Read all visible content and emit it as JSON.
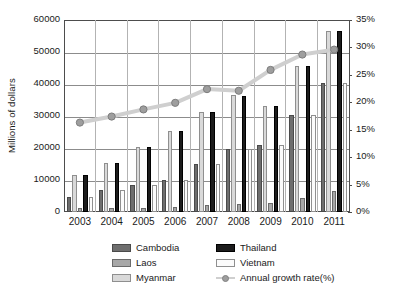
{
  "chart_data": {
    "type": "bar",
    "title": "",
    "xlabel": "",
    "ylabel": "Millions of dollars",
    "y2label": "",
    "categories": [
      "2003",
      "2004",
      "2005",
      "2006",
      "2007",
      "2008",
      "2009",
      "2010",
      "2011"
    ],
    "ylim": [
      0,
      60000
    ],
    "y2lim": [
      0,
      35
    ],
    "yticks": [
      "0",
      "10000",
      "20000",
      "30000",
      "40000",
      "50000",
      "60000"
    ],
    "y2ticks": [
      "0%",
      "5%",
      "10%",
      "15%",
      "20%",
      "25%",
      "30%",
      "35%"
    ],
    "grid": true,
    "legend_position": "bottom",
    "series": [
      {
        "name": "Cambodia",
        "axis": "left",
        "color": "#6e6e6e",
        "values": [
          4700,
          6900,
          8300,
          10000,
          15000,
          19700,
          21000,
          30200,
          40200
        ]
      },
      {
        "name": "Myanmar",
        "axis": "left",
        "color": "#d9d9d9",
        "values": [
          11600,
          15200,
          20300,
          25400,
          31200,
          36500,
          33200,
          45700,
          56700
        ]
      },
      {
        "name": "Laos",
        "axis": "left",
        "color": "#a8a8a8",
        "values": [
          1100,
          1300,
          1300,
          1600,
          2200,
          2600,
          2900,
          4400,
          6600
        ]
      },
      {
        "name": "Thailand",
        "axis": "left",
        "color": "#1c1c1c",
        "values": [
          11600,
          15200,
          20300,
          25400,
          31200,
          36400,
          33200,
          45700,
          56700
        ]
      },
      {
        "name": "Vietnam",
        "axis": "left",
        "color": "#fbfbfb",
        "values": [
          4700,
          6900,
          8300,
          10000,
          15000,
          19800,
          21000,
          30200,
          40200
        ]
      },
      {
        "name": "Annual growth rate(%)",
        "axis": "right",
        "type": "line",
        "color": "#cfcfcf",
        "values": [
          16.3,
          17.4,
          18.7,
          19.9,
          22.4,
          22.1,
          25.9,
          28.7,
          29.6
        ]
      }
    ]
  },
  "legend": {
    "items": [
      {
        "label": "Cambodia",
        "kind": "swatch"
      },
      {
        "label": "Thailand",
        "kind": "swatch"
      },
      {
        "label": "Laos",
        "kind": "swatch"
      },
      {
        "label": "Vietnam",
        "kind": "swatch"
      },
      {
        "label": "Myanmar",
        "kind": "swatch"
      },
      {
        "label": "Annual growth rate(%)",
        "kind": "line"
      }
    ]
  }
}
